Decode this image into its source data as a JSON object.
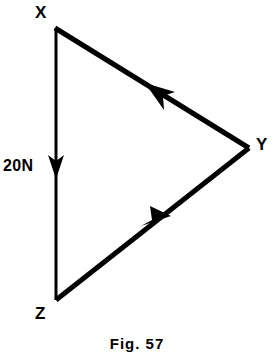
{
  "figure": {
    "caption": "Fig. 57",
    "background_color": "#ffffff",
    "stroke_color": "#000000"
  },
  "diagram": {
    "type": "force-triangle",
    "vertices": [
      {
        "id": "X",
        "label": "X",
        "x": 55,
        "y": 27
      },
      {
        "id": "Y",
        "label": "Y",
        "x": 248,
        "y": 148
      },
      {
        "id": "Z",
        "label": "Z",
        "x": 56,
        "y": 300
      }
    ],
    "edges": [
      {
        "id": "XZ",
        "from": "X",
        "to": "Z",
        "label": "20N",
        "direction": "down",
        "arrow_at": {
          "x": 56,
          "y": 172
        },
        "stroke_width": 3
      },
      {
        "id": "ZY",
        "from": "Z",
        "to": "Y",
        "label": "",
        "direction": "up-right",
        "arrow_at": {
          "x": 160,
          "y": 224
        },
        "stroke_width": 5
      },
      {
        "id": "YX",
        "from": "Y",
        "to": "X",
        "label": "",
        "direction": "up-left",
        "arrow_at": {
          "x": 158,
          "y": 89
        },
        "stroke_width": 5
      }
    ],
    "force_label": "20N",
    "force_magnitude": 20,
    "force_unit": "N"
  }
}
